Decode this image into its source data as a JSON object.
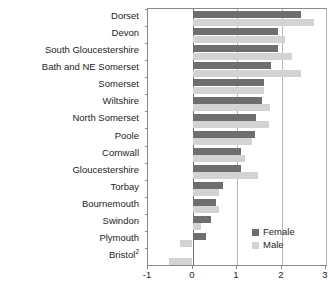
{
  "chart_data": {
    "type": "bar",
    "orientation": "horizontal",
    "title": "",
    "xlabel": "",
    "ylabel": "",
    "xlim": [
      -1,
      3
    ],
    "xticks": [
      -1,
      0,
      1,
      2,
      3
    ],
    "xtick_labels": [
      "-1",
      "0",
      "1",
      "2",
      "3"
    ],
    "grid": true,
    "grid_axis": "x",
    "legend_position": "inside-right-lower",
    "categories": [
      "Dorset",
      "Devon",
      "South Gloucestershire",
      "Bath and NE Somerset",
      "Somerset",
      "Wiltshire",
      "North Somerset",
      "Poole",
      "Cornwall",
      "Gloucestershire",
      "Torbay",
      "Bournemouth",
      "Swindon",
      "Plymouth",
      "Bristol"
    ],
    "category_footnotes": {
      "Bristol": "2"
    },
    "series": [
      {
        "name": "Female",
        "color": "#6d6e71",
        "values": [
          2.43,
          1.92,
          1.92,
          1.77,
          1.6,
          1.57,
          1.42,
          1.4,
          1.08,
          1.08,
          0.68,
          0.52,
          0.42,
          0.3,
          0.0
        ]
      },
      {
        "name": "Male",
        "color": "#d3d3d3",
        "values": [
          2.72,
          2.08,
          2.23,
          2.43,
          1.6,
          1.75,
          1.72,
          1.33,
          1.17,
          1.47,
          0.6,
          0.6,
          0.18,
          -0.28,
          -0.53
        ]
      }
    ]
  },
  "legend": {
    "items": [
      {
        "label": "Female",
        "color": "#6d6e71"
      },
      {
        "label": "Male",
        "color": "#d3d3d3"
      }
    ]
  },
  "colors": {
    "female": "#6d6e71",
    "male": "#d3d3d3",
    "axis": "#8a8a8a",
    "grid": "#b8b8b8",
    "text": "#231f20"
  }
}
